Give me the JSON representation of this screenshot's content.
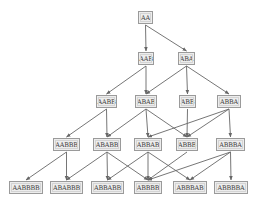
{
  "diagram": {
    "type": "directed-acyclic-graph",
    "colors": {
      "node_fill": "#ededed",
      "node_border": "#9a9a9a",
      "edge": "#666666",
      "text": "#444444"
    },
    "nodes": [
      {
        "id": "AA",
        "label": "AA",
        "x": 138,
        "y": 11,
        "w": 15
      },
      {
        "id": "AAB",
        "label": "AAB",
        "x": 138,
        "y": 52,
        "w": 16
      },
      {
        "id": "ABA",
        "label": "ABA",
        "x": 178,
        "y": 52,
        "w": 17
      },
      {
        "id": "AABB",
        "label": "AABB",
        "x": 96,
        "y": 95,
        "w": 21
      },
      {
        "id": "ABAB",
        "label": "ABAB",
        "x": 135,
        "y": 95,
        "w": 22
      },
      {
        "id": "ABB",
        "label": "ABB",
        "x": 179,
        "y": 95,
        "w": 17
      },
      {
        "id": "ABBA",
        "label": "ABBA",
        "x": 217,
        "y": 95,
        "w": 24
      },
      {
        "id": "AABBB",
        "label": "AABBB",
        "x": 53,
        "y": 138,
        "w": 27
      },
      {
        "id": "ABABB",
        "label": "ABABB",
        "x": 93,
        "y": 138,
        "w": 28
      },
      {
        "id": "ABBAB",
        "label": "ABBAB",
        "x": 134,
        "y": 138,
        "w": 28
      },
      {
        "id": "ABBB",
        "label": "ABBB",
        "x": 176,
        "y": 138,
        "w": 22
      },
      {
        "id": "ABBBA",
        "label": "ABBBA",
        "x": 216,
        "y": 138,
        "w": 29
      },
      {
        "id": "AABBBB",
        "label": "AABBBB",
        "x": 9,
        "y": 181,
        "w": 34
      },
      {
        "id": "ABABBB",
        "label": "ABABBB",
        "x": 50,
        "y": 181,
        "w": 33
      },
      {
        "id": "ABBABB",
        "label": "ABBABB",
        "x": 91,
        "y": 181,
        "w": 33
      },
      {
        "id": "ABBBB",
        "label": "ABBBB",
        "x": 134,
        "y": 181,
        "w": 28
      },
      {
        "id": "ABBBAB",
        "label": "ABBBAB",
        "x": 173,
        "y": 181,
        "w": 34
      },
      {
        "id": "ABBBBA",
        "label": "ABBBBA",
        "x": 214,
        "y": 181,
        "w": 34
      }
    ],
    "edges": [
      [
        "AA",
        "AAB"
      ],
      [
        "AA",
        "ABA"
      ],
      [
        "AAB",
        "AABB"
      ],
      [
        "AAB",
        "ABAB"
      ],
      [
        "ABA",
        "ABAB"
      ],
      [
        "ABA",
        "ABB"
      ],
      [
        "ABA",
        "ABBA"
      ],
      [
        "AABB",
        "AABBB"
      ],
      [
        "AABB",
        "ABABB"
      ],
      [
        "ABAB",
        "ABABB"
      ],
      [
        "ABAB",
        "ABBAB"
      ],
      [
        "ABAB",
        "ABBB"
      ],
      [
        "ABB",
        "ABBB"
      ],
      [
        "ABBA",
        "ABBAB"
      ],
      [
        "ABBA",
        "ABBB"
      ],
      [
        "ABBA",
        "ABBBA"
      ],
      [
        "AABBB",
        "AABBBB"
      ],
      [
        "AABBB",
        "ABABBB"
      ],
      [
        "ABABB",
        "ABABBB"
      ],
      [
        "ABABB",
        "ABBABB"
      ],
      [
        "ABABB",
        "ABBBB"
      ],
      [
        "ABBAB",
        "ABBABB"
      ],
      [
        "ABBAB",
        "ABBBB"
      ],
      [
        "ABBAB",
        "ABBBAB"
      ],
      [
        "ABBB",
        "ABBBB"
      ],
      [
        "ABBBA",
        "ABBBB"
      ],
      [
        "ABBBA",
        "ABBBAB"
      ],
      [
        "ABBBA",
        "ABBBBA"
      ]
    ]
  }
}
